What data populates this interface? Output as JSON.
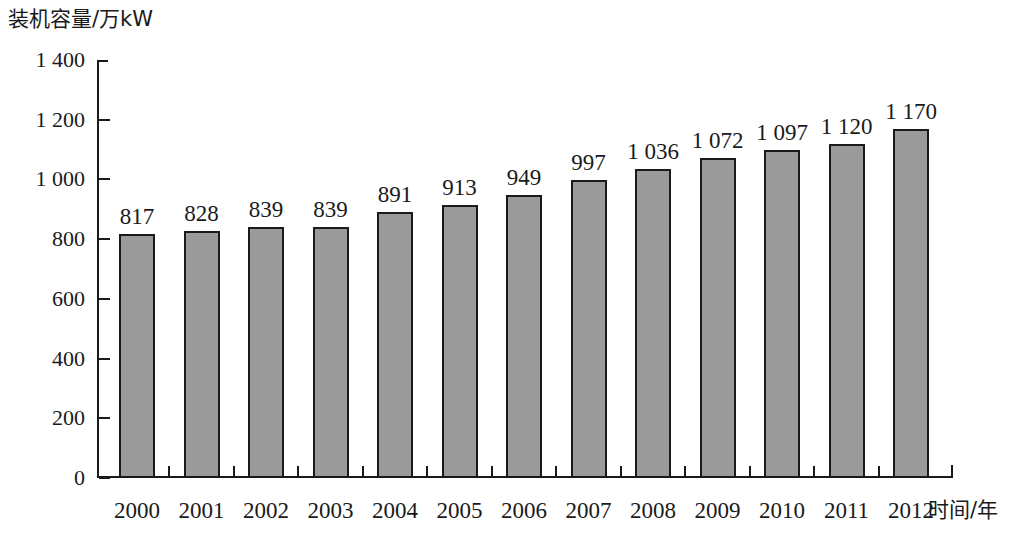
{
  "chart_data": {
    "type": "bar",
    "title": "",
    "ylabel": "装机容量/万kW",
    "xlabel": "时间/年",
    "categories": [
      "2000",
      "2001",
      "2002",
      "2003",
      "2004",
      "2005",
      "2006",
      "2007",
      "2008",
      "2009",
      "2010",
      "2011",
      "2012"
    ],
    "values": [
      817,
      828,
      839,
      839,
      891,
      913,
      949,
      997,
      1036,
      1072,
      1097,
      1120,
      1170
    ],
    "value_labels": [
      "817",
      "828",
      "839",
      "839",
      "891",
      "913",
      "949",
      "997",
      "1 036",
      "1 072",
      "1 097",
      "1 120",
      "1 170"
    ],
    "ylim": [
      0,
      1400
    ],
    "ytick_values": [
      0,
      200,
      400,
      600,
      800,
      1000,
      1200,
      1400
    ],
    "ytick_labels": [
      "0",
      "200",
      "400",
      "600",
      "800",
      "1 000",
      "1 200",
      "1 400"
    ],
    "grid": false,
    "legend": null,
    "bar_fill_color": "#9a9a9a",
    "bar_border_color": "#1a1a1a",
    "axis_color": "#1a1a1a"
  }
}
